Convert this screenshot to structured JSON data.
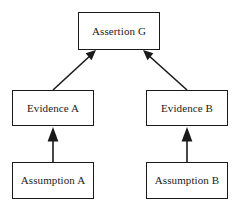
{
  "diagram": {
    "type": "argument-structure-diagram",
    "background_color": "#ffffff",
    "line_color": "#1a1a1a",
    "box_fill": "#ffffff",
    "nodes": [
      {
        "id": "assertion-g",
        "label": "Assertion G",
        "role": "claim"
      },
      {
        "id": "evidence-a",
        "label": "Evidence A",
        "role": "evidence"
      },
      {
        "id": "evidence-b",
        "label": "Evidence B",
        "role": "evidence"
      },
      {
        "id": "assumption-a",
        "label": "Assumption A",
        "role": "assumption"
      },
      {
        "id": "assumption-b",
        "label": "Assumption B",
        "role": "assumption"
      }
    ],
    "edges": [
      {
        "id": "edge-evidence-a-to-assertion-g",
        "from": "evidence-a",
        "to": "assertion-g",
        "style": "solid",
        "arrowhead": "filled-triangle",
        "orientation": "diagonal"
      },
      {
        "id": "edge-evidence-b-to-assertion-g",
        "from": "evidence-b",
        "to": "assertion-g",
        "style": "solid",
        "arrowhead": "filled-triangle",
        "orientation": "diagonal"
      },
      {
        "id": "edge-assumption-a-to-evidence-a",
        "from": "assumption-a",
        "to": "evidence-a",
        "style": "solid",
        "arrowhead": "filled-triangle",
        "orientation": "vertical"
      },
      {
        "id": "edge-assumption-b-to-evidence-b",
        "from": "assumption-b",
        "to": "evidence-b",
        "style": "solid",
        "arrowhead": "filled-triangle",
        "orientation": "vertical"
      }
    ]
  }
}
